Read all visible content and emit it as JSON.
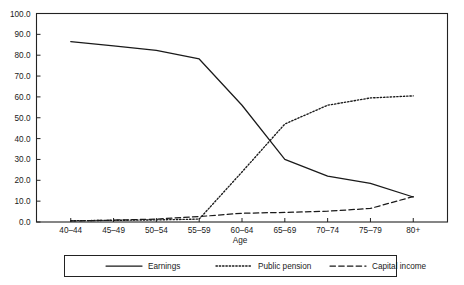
{
  "chart_data": {
    "type": "line",
    "title": "",
    "xlabel": "Age",
    "ylabel": "",
    "categories": [
      "40–44",
      "45–49",
      "50–54",
      "55–59",
      "60–64",
      "65–69",
      "70–74",
      "75–79",
      "80+"
    ],
    "x_tick_labels": [
      "40–44",
      "45–49",
      "50–54",
      "55–59",
      "60–64",
      "65–69",
      "70–74",
      "75–79",
      "80+"
    ],
    "y_tick_labels": [
      "0.0",
      "10.0",
      "20.0",
      "30.0",
      "40.0",
      "50.0",
      "60.0",
      "70.0",
      "80.0",
      "90.0",
      "100.0"
    ],
    "y_ticks": [
      0,
      10,
      20,
      30,
      40,
      50,
      60,
      70,
      80,
      90,
      100
    ],
    "ylim": [
      0,
      100
    ],
    "grid": false,
    "legend_position": "bottom-outside",
    "series": [
      {
        "name": "Earnings",
        "style": "solid",
        "color": "#1a1a1a",
        "values": [
          86.5,
          84.5,
          82.3,
          78.2,
          56.0,
          30.0,
          22.0,
          18.5,
          12.0
        ]
      },
      {
        "name": "Public pension",
        "style": "dotted",
        "color": "#1a1a1a",
        "values": [
          0.6,
          0.8,
          1.0,
          1.4,
          24.0,
          47.0,
          56.0,
          59.5,
          60.5
        ]
      },
      {
        "name": "Capital income",
        "style": "dashed",
        "color": "#1a1a1a",
        "values": [
          0.5,
          0.9,
          1.4,
          2.6,
          4.2,
          4.6,
          5.2,
          6.5,
          12.2
        ]
      }
    ]
  },
  "axis": {
    "x_title": "Age",
    "y_title": ""
  },
  "legend": {
    "items": [
      {
        "label": "Earnings",
        "style": "solid"
      },
      {
        "label": "Public pension",
        "style": "dotted"
      },
      {
        "label": "Capital income",
        "style": "dashed"
      }
    ]
  },
  "colors": {
    "line": "#1a1a1a",
    "frame": "#222222",
    "background": "#ffffff"
  }
}
